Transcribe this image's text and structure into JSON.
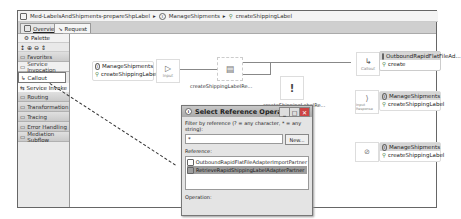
{
  "breadcrumb": {
    "items": [
      {
        "icon": "module-icon",
        "label": "Med-LabelsAndShipments-prepareShpLabel"
      },
      {
        "icon": "interface-icon",
        "label": "ManageShipments"
      },
      {
        "icon": "operation-icon",
        "label": "createShippingLabel"
      }
    ],
    "separator": "▸"
  },
  "tabs": [
    {
      "label": "Overview",
      "icon": "overview-icon",
      "active": false
    },
    {
      "label": "Request",
      "icon": "request-icon",
      "active": true
    }
  ],
  "palette": {
    "header": "Palette",
    "tools": [
      "↕",
      "⊕",
      "⊖",
      "⇕"
    ],
    "drawers": [
      {
        "label": "Favorites",
        "type": "drawer"
      },
      {
        "label": "Service Invocation",
        "type": "drawer-light"
      },
      {
        "label": "Callout",
        "type": "tool-selected"
      },
      {
        "label": "Service Invoke",
        "type": "tool"
      },
      {
        "label": "Routing",
        "type": "drawer"
      },
      {
        "label": "Transformation",
        "type": "drawer"
      },
      {
        "label": "Tracing",
        "type": "drawer"
      },
      {
        "label": "Error Handling",
        "type": "drawer"
      },
      {
        "label": "Mediation Subflow",
        "type": "drawer"
      }
    ]
  },
  "canvas": {
    "input_node": {
      "interface": "ManageShipments",
      "operation": "createShippingLabel"
    },
    "input_prim_label": "Input",
    "mid_node1_label": "createShippingLabelRe...",
    "mid_node2_label": "createShippingLabelRe...",
    "callout_node": {
      "prim_label": "Callout",
      "partner": "OutboundRapidFlatFileAd...",
      "operation": "create"
    },
    "input_response_node": {
      "prim_label": "Input Response",
      "interface": "ManageShipments",
      "operation": "createShippingLabel"
    },
    "input_fault_node": {
      "interface": "ManageShipments",
      "operation": "createShippingLabel"
    }
  },
  "dialog": {
    "title": "Select Reference Operation",
    "filter_label": "Filter by reference (? = any character, * = any string):",
    "filter_value": "*",
    "new_button": "New...",
    "reference_label": "Reference:",
    "references": [
      {
        "label": "OutboundRapidFlatFileAdapterImportPartner",
        "selected": false
      },
      {
        "label": "RetrieveRapidShippingLabelAdapterPartner",
        "selected": true
      }
    ],
    "operation_label": "Operation:",
    "win_buttons": [
      "_",
      "□",
      "✕"
    ]
  }
}
